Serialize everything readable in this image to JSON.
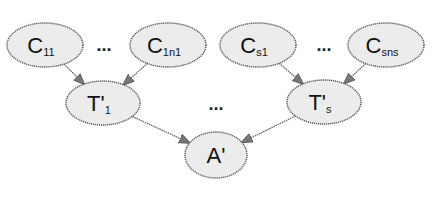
{
  "diagram": {
    "type": "directed-graph",
    "nodes": [
      {
        "id": "C11",
        "base": "C",
        "sub": "11",
        "prime": ""
      },
      {
        "id": "C1n1",
        "base": "C",
        "sub": "1n1",
        "prime": ""
      },
      {
        "id": "Cs1",
        "base": "C",
        "sub": "s1",
        "prime": ""
      },
      {
        "id": "Csns",
        "base": "C",
        "sub": "sns",
        "prime": ""
      },
      {
        "id": "T1",
        "base": "T'",
        "sub": "1",
        "prime": "'"
      },
      {
        "id": "Ts",
        "base": "T'",
        "sub": "s",
        "prime": "'"
      },
      {
        "id": "A",
        "base": "A'",
        "sub": "",
        "prime": "'"
      }
    ],
    "edges": [
      {
        "from": "C11",
        "to": "T1"
      },
      {
        "from": "C1n1",
        "to": "T1"
      },
      {
        "from": "Cs1",
        "to": "Ts"
      },
      {
        "from": "Csns",
        "to": "Ts"
      },
      {
        "from": "T1",
        "to": "A"
      },
      {
        "from": "Ts",
        "to": "A"
      }
    ],
    "ellipses": [
      "...",
      "...",
      "..."
    ],
    "colors": {
      "node_fill": "#ececec",
      "stroke": "#555555"
    }
  }
}
